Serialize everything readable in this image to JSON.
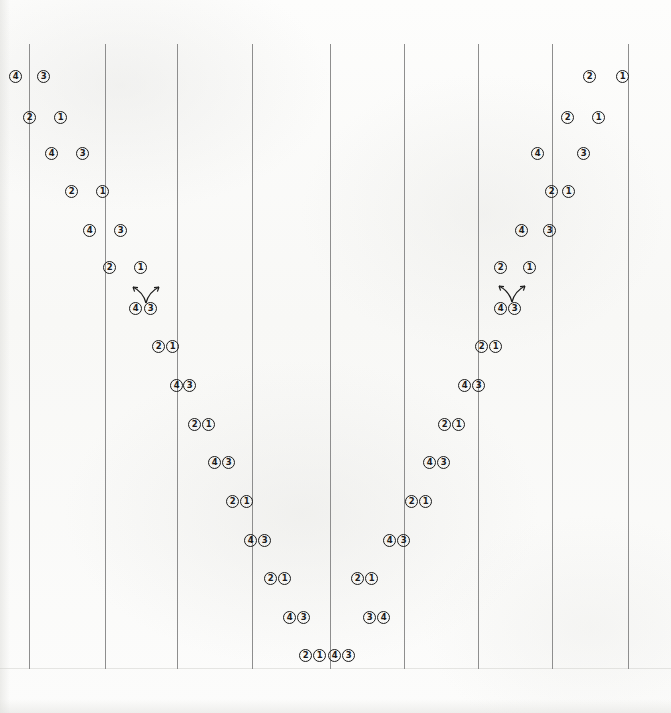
{
  "figure": {
    "background_color": "#fbfbfa",
    "line_color": "#8e8e8e",
    "marker_ink_color": "#1b1b1b",
    "width": 671,
    "height": 713
  },
  "gridlines": {
    "count": 9,
    "x_positions": [
      29,
      105,
      177,
      252,
      330,
      404,
      478,
      552,
      628
    ],
    "top": 44,
    "bottom": 669
  },
  "annotations": [
    {
      "name": "double-arrow-left",
      "x": 126,
      "y": 283,
      "label": ""
    },
    {
      "name": "double-arrow-right",
      "x": 492,
      "y": 282,
      "label": ""
    }
  ],
  "chart_data": {
    "type": "scatter",
    "title": "",
    "xlabel": "",
    "ylabel": "",
    "grid": true,
    "legend": null,
    "xlim": [
      0,
      671
    ],
    "ylim": [
      0,
      713
    ],
    "marker_style": "circled digit",
    "series": [
      {
        "name": "left-branch-descending",
        "labels": [
          "4",
          "3",
          "2",
          "1",
          "4",
          "3",
          "2",
          "1",
          "4",
          "3",
          "2",
          "1",
          "4",
          "3",
          "2",
          "1",
          "4",
          "3",
          "2",
          "1",
          "4",
          "3",
          "2",
          "1",
          "4",
          "3",
          "2",
          "1",
          "4",
          "3"
        ],
        "points": [
          [
            15,
            76
          ],
          [
            43,
            76
          ],
          [
            29,
            117
          ],
          [
            60,
            117
          ],
          [
            51,
            153
          ],
          [
            82,
            153
          ],
          [
            71,
            191
          ],
          [
            102,
            191
          ],
          [
            89,
            230
          ],
          [
            120,
            230
          ],
          [
            109,
            267
          ],
          [
            140,
            267
          ],
          [
            135,
            308
          ],
          [
            150,
            308
          ],
          [
            158,
            346
          ],
          [
            172,
            346
          ],
          [
            176,
            385
          ],
          [
            189,
            385
          ],
          [
            194,
            424
          ],
          [
            208,
            424
          ],
          [
            214,
            462
          ],
          [
            228,
            462
          ],
          [
            232,
            501
          ],
          [
            246,
            501
          ],
          [
            250,
            540
          ],
          [
            264,
            540
          ],
          [
            270,
            578
          ],
          [
            284,
            578
          ],
          [
            289,
            617
          ],
          [
            303,
            617
          ]
        ]
      },
      {
        "name": "left-branch-bottom",
        "labels": [
          "2",
          "1",
          "4",
          "3"
        ],
        "points": [
          [
            305,
            655
          ],
          [
            319,
            655
          ],
          [
            334,
            655
          ],
          [
            348,
            655
          ]
        ]
      },
      {
        "name": "right-branch-ascending",
        "labels": [
          "3",
          "4",
          "2",
          "1",
          "4",
          "3",
          "2",
          "1",
          "4",
          "3",
          "2",
          "1",
          "4",
          "3",
          "2",
          "1",
          "4",
          "3",
          "2",
          "1",
          "4",
          "3",
          "2",
          "1",
          "4",
          "3",
          "2",
          "1",
          "2",
          "1"
        ],
        "points": [
          [
            369,
            617
          ],
          [
            383,
            617
          ],
          [
            357,
            578
          ],
          [
            371,
            578
          ],
          [
            389,
            540
          ],
          [
            403,
            540
          ],
          [
            411,
            501
          ],
          [
            425,
            501
          ],
          [
            429,
            462
          ],
          [
            443,
            462
          ],
          [
            444,
            424
          ],
          [
            458,
            424
          ],
          [
            464,
            385
          ],
          [
            478,
            385
          ],
          [
            481,
            346
          ],
          [
            495,
            346
          ],
          [
            500,
            308
          ],
          [
            514,
            308
          ],
          [
            500,
            267
          ],
          [
            529,
            267
          ],
          [
            521,
            230
          ],
          [
            549,
            230
          ],
          [
            551,
            191
          ],
          [
            568,
            191
          ],
          [
            537,
            153
          ],
          [
            583,
            153
          ],
          [
            567,
            117
          ],
          [
            598,
            117
          ],
          [
            589,
            76
          ],
          [
            622,
            76
          ]
        ]
      }
    ],
    "marker_labels_used": [
      "1",
      "2",
      "3",
      "4"
    ]
  }
}
